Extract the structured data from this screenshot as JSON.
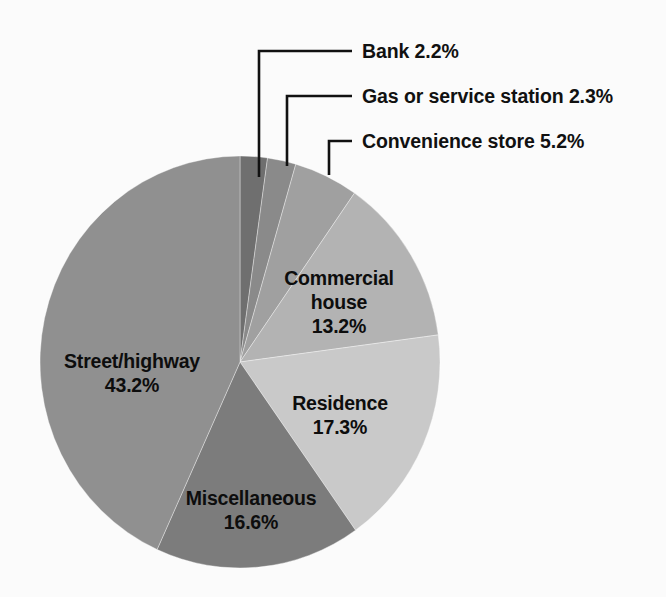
{
  "chart_data": {
    "type": "pie",
    "title": "",
    "subtitle": "",
    "xlabel": "",
    "ylabel": "",
    "legend_position": "none",
    "grid": false,
    "units": "percent",
    "total": 100.0,
    "start_angle_deg": -90,
    "direction": "clockwise",
    "categories": [
      "Bank",
      "Gas or service station",
      "Convenience store",
      "Commercial house",
      "Residence",
      "Miscellaneous",
      "Street/highway"
    ],
    "values": [
      2.2,
      2.3,
      5.2,
      13.2,
      17.3,
      16.6,
      43.2
    ],
    "slices": [
      {
        "name": "Bank",
        "value": 2.2,
        "value_label": "2.2%",
        "full_label": "Bank 2.2%",
        "color": "#6f6f6f",
        "label_placement": "callout"
      },
      {
        "name": "Gas or service station",
        "value": 2.3,
        "value_label": "2.3%",
        "full_label": "Gas or service station 2.3%",
        "color": "#8a8a8a",
        "label_placement": "callout"
      },
      {
        "name": "Convenience store",
        "value": 5.2,
        "value_label": "5.2%",
        "full_label": "Convenience store 5.2%",
        "color": "#a0a0a0",
        "label_placement": "callout"
      },
      {
        "name": "Commercial house",
        "value": 13.2,
        "value_label": "13.2%",
        "full_label": "Commercial house 13.2%",
        "color": "#b3b3b3",
        "label_placement": "inside",
        "label_lines": [
          "Commercial",
          "house",
          "13.2%"
        ]
      },
      {
        "name": "Residence",
        "value": 17.3,
        "value_label": "17.3%",
        "full_label": "Residence 17.3%",
        "color": "#c9c9c9",
        "label_placement": "inside",
        "label_lines": [
          "Residence",
          "17.3%"
        ]
      },
      {
        "name": "Miscellaneous",
        "value": 16.6,
        "value_label": "16.6%",
        "full_label": "Miscellaneous 16.6%",
        "color": "#7c7c7c",
        "label_placement": "inside",
        "label_lines": [
          "Miscellaneous",
          "16.6%"
        ]
      },
      {
        "name": "Street/highway",
        "value": 43.2,
        "value_label": "43.2%",
        "full_label": "Street/highway 43.2%",
        "color": "#909090",
        "label_placement": "inside",
        "label_lines": [
          "Street/highway",
          "43.2%"
        ]
      }
    ]
  },
  "callouts": [
    {
      "id": "bank",
      "text": "Bank 2.2%"
    },
    {
      "id": "gas-or-service-station",
      "text": "Gas or service station 2.3%"
    },
    {
      "id": "convenience-store",
      "text": "Convenience store 5.2%"
    }
  ],
  "inside_labels": {
    "commercial_house": {
      "line1": "Commercial",
      "line2": "house",
      "line3": "13.2%"
    },
    "residence": {
      "line1": "Residence",
      "line2": "17.3%"
    },
    "miscellaneous": {
      "line1": "Miscellaneous",
      "line2": "16.6%"
    },
    "street_highway": {
      "line1": "Street/highway",
      "line2": "43.2%"
    }
  },
  "colors": {
    "background": "#fbfbfb",
    "text": "#111111",
    "leader_line": "#111111"
  }
}
